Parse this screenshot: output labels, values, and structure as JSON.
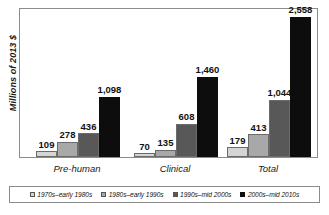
{
  "chart_data": {
    "type": "bar",
    "title": "",
    "subtitle": "",
    "xlabel": "",
    "ylabel": "Millions of 2013 $",
    "ylim": [
      0,
      2700
    ],
    "grid": false,
    "legend_position": "bottom",
    "categories": [
      "Pre-human",
      "Clinical",
      "Total"
    ],
    "series": [
      {
        "name": "1970s–early 1980s",
        "color": "#d4d4d4",
        "values": [
          109,
          70,
          179
        ],
        "labels": [
          "109",
          "70",
          "179"
        ]
      },
      {
        "name": "1980s–early 1990s",
        "color": "#a8a8a8",
        "values": [
          278,
          135,
          413
        ],
        "labels": [
          "278",
          "135",
          "413"
        ]
      },
      {
        "name": "1990s–mid 2000s",
        "color": "#585858",
        "values": [
          436,
          608,
          1044
        ],
        "labels": [
          "436",
          "608",
          "1,044"
        ]
      },
      {
        "name": "2000s–mid 2010s",
        "color": "#0d0d0d",
        "values": [
          1098,
          1460,
          2558
        ],
        "labels": [
          "1,098",
          "1,460",
          "2,558"
        ]
      }
    ]
  },
  "axis": {
    "y_title": "Millions of 2013 $"
  },
  "legend": {
    "items": [
      {
        "label": "1970s–early 1980s",
        "color": "#d4d4d4"
      },
      {
        "label": "1980s–early 1990s",
        "color": "#a8a8a8"
      },
      {
        "label": "1990s–mid 2000s",
        "color": "#585858"
      },
      {
        "label": "2000s–mid 2010s",
        "color": "#0d0d0d"
      }
    ]
  },
  "categories": [
    {
      "label": "Pre-human"
    },
    {
      "label": "Clinical"
    },
    {
      "label": "Total"
    }
  ],
  "colors": {
    "frame": "#8c8c8c",
    "bar_outline": "#6b6b6b",
    "text": "#111111"
  }
}
